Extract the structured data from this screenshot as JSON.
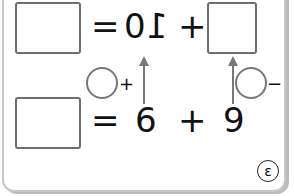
{
  "top_row": {
    "equals": "=",
    "digit_zero": "0",
    "digit_one_mirrored": "1",
    "plus": "+"
  },
  "bottom_row": {
    "equals": "=",
    "left_number": "6",
    "plus": "+",
    "right_number": "9"
  },
  "helpers": {
    "left_circle_op": "+",
    "right_circle_op": "−"
  },
  "badge": {
    "label": "ε"
  }
}
